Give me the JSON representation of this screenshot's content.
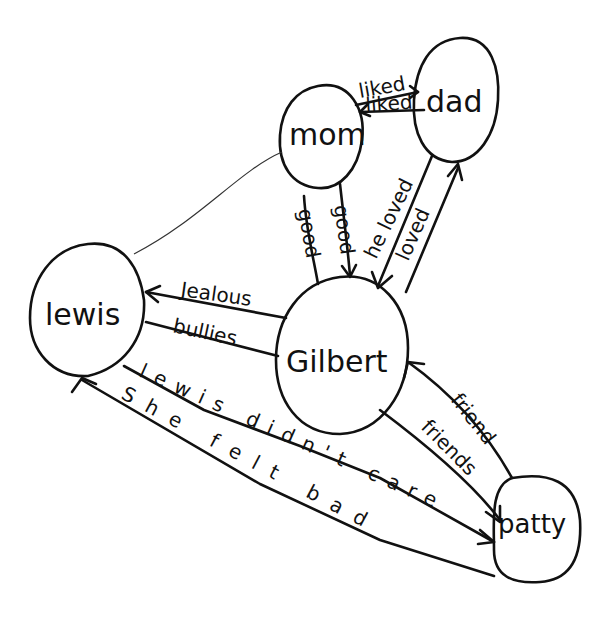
{
  "diagram": {
    "type": "hand-drawn character relationship map",
    "ink_color": "#111111",
    "background": "#ffffff",
    "nodes": [
      {
        "id": "mom",
        "label": "mom"
      },
      {
        "id": "dad",
        "label": "dad"
      },
      {
        "id": "lewis",
        "label": "lewis"
      },
      {
        "id": "gilbert",
        "label": "Gilbert"
      },
      {
        "id": "patty",
        "label": "patty"
      }
    ],
    "edges": [
      {
        "from": "mom",
        "to": "dad",
        "label": "liked"
      },
      {
        "from": "dad",
        "to": "mom",
        "label": "liked"
      },
      {
        "from": "mom",
        "to": "gilbert",
        "label": "good"
      },
      {
        "from": "mom",
        "to": "gilbert",
        "label": "good"
      },
      {
        "from": "dad",
        "to": "gilbert",
        "label": "he loved"
      },
      {
        "from": "gilbert",
        "to": "dad",
        "label": "loved"
      },
      {
        "from": "gilbert",
        "to": "lewis",
        "label": "Jealous"
      },
      {
        "from": "lewis",
        "to": "gilbert",
        "label": "bullies"
      },
      {
        "from": "patty",
        "to": "gilbert",
        "label": "friend"
      },
      {
        "from": "gilbert",
        "to": "patty",
        "label": "friends"
      },
      {
        "from": "lewis",
        "to": "patty",
        "label": "lewis didn't care"
      },
      {
        "from": "patty",
        "to": "lewis",
        "label": "She felt bad"
      },
      {
        "from": "mom",
        "to": "lewis",
        "label": ""
      }
    ]
  }
}
